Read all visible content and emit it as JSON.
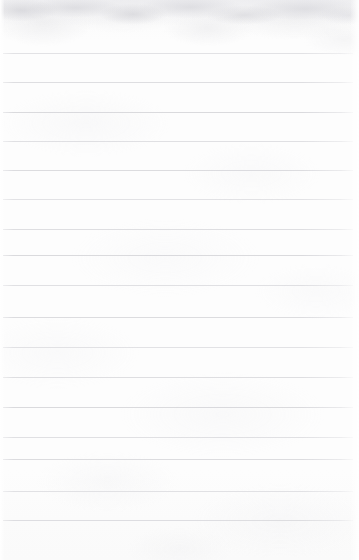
{
  "document": {
    "kind": "scanned-notebook-page",
    "title": "Blank ruled notebook page",
    "page_text": "",
    "has_handwriting": false,
    "has_printed_text": false,
    "width_px": 359,
    "height_px": 560
  },
  "paper": {
    "background_color": "#fdfdfd",
    "edge_tint_color": "#ffffff",
    "texture_tint_color": "#e4e4e8",
    "top_band_color": "#ececef"
  },
  "ruling": {
    "line_color": "#d8d8dc",
    "line_thickness_px": 1,
    "line_spacing_px": 30,
    "line_start_x_px": 3,
    "line_end_x_px": 353,
    "top_margin_px": 53,
    "bottom_margin_px": 40,
    "line_count": 17,
    "line_y_positions": [
      53,
      82,
      112,
      141,
      170,
      199,
      229,
      255,
      285,
      317,
      347,
      377,
      407,
      437,
      459,
      491,
      520
    ]
  },
  "content": {
    "lines": [
      {
        "index": 1,
        "text": ""
      },
      {
        "index": 2,
        "text": ""
      },
      {
        "index": 3,
        "text": ""
      },
      {
        "index": 4,
        "text": ""
      },
      {
        "index": 5,
        "text": ""
      },
      {
        "index": 6,
        "text": ""
      },
      {
        "index": 7,
        "text": ""
      },
      {
        "index": 8,
        "text": ""
      },
      {
        "index": 9,
        "text": ""
      },
      {
        "index": 10,
        "text": ""
      },
      {
        "index": 11,
        "text": ""
      },
      {
        "index": 12,
        "text": ""
      },
      {
        "index": 13,
        "text": ""
      },
      {
        "index": 14,
        "text": ""
      },
      {
        "index": 15,
        "text": ""
      },
      {
        "index": 16,
        "text": ""
      },
      {
        "index": 17,
        "text": ""
      }
    ]
  }
}
